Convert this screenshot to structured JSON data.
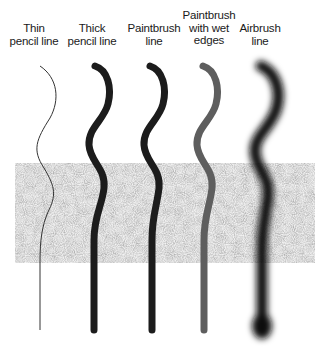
{
  "labels": [
    {
      "id": "thin-pencil",
      "text": "Thin\npencil line",
      "x": 34,
      "y": 22
    },
    {
      "id": "thick-pencil",
      "text": "Thick\npencil line",
      "x": 92,
      "y": 22
    },
    {
      "id": "paintbrush",
      "text": "Paintbrush\nline",
      "x": 154,
      "y": 22
    },
    {
      "id": "paintbrush-wet",
      "text": "Paintbrush\nwith wet\nedges",
      "x": 209,
      "y": 9
    },
    {
      "id": "airbrush",
      "text": "Airbrush\nline",
      "x": 260,
      "y": 22
    }
  ],
  "texture_block": {
    "x": 15,
    "y": 163,
    "width": 300,
    "height": 100,
    "base_color": "#c8c8c8"
  },
  "strokes": [
    {
      "id": "thin-pencil",
      "color": "#333333",
      "width": 1
    },
    {
      "id": "thick-pencil",
      "color": "#1c1c1c",
      "width": 7
    },
    {
      "id": "paintbrush",
      "color": "#1c1c1c",
      "width": 7
    },
    {
      "id": "paintbrush-wet",
      "color": "#5a5a5a",
      "width": 7
    },
    {
      "id": "airbrush",
      "color": "#111111",
      "width": 12
    }
  ]
}
